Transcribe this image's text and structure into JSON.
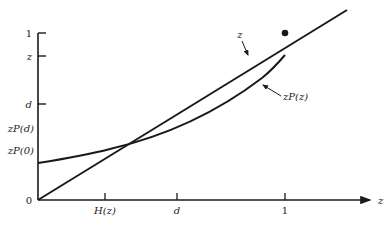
{
  "diagram": {
    "colors": {
      "ink": "#1a1a1a",
      "background": "#ffffff"
    },
    "x_axis": {
      "label": "z",
      "ticks": [
        {
          "label": "H(z)",
          "x": 105
        },
        {
          "label": "d",
          "x": 177
        },
        {
          "label": "1",
          "x": 285
        }
      ]
    },
    "y_axis": {
      "origin_label": "0",
      "ticks": [
        {
          "label": "1",
          "y": 33,
          "has_tick": true
        },
        {
          "label": "z",
          "y": 56,
          "has_tick": true
        },
        {
          "label": "d",
          "y": 104,
          "has_tick": true
        },
        {
          "label": "zP(d)",
          "y": 128,
          "has_tick": false
        },
        {
          "label": "zP(0)",
          "y": 150,
          "has_tick": false
        }
      ]
    },
    "curves": [
      {
        "name": "z",
        "label": "z",
        "description": "straight line through origin"
      },
      {
        "name": "zP(z)",
        "label": "zP(z)",
        "description": "convex increasing curve starting above origin"
      }
    ],
    "annotations": {
      "line_label": "z",
      "curve_label": "zP(z)",
      "marked_point": "intersection of line z with vertical at z=1 height (dot)"
    }
  }
}
